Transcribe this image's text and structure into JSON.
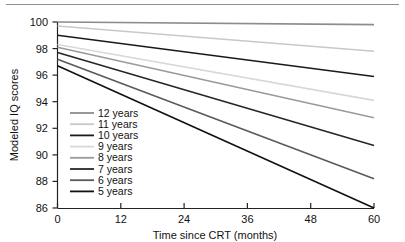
{
  "chart_data": {
    "type": "line",
    "title": "",
    "xlabel": "Time since CRT (months)",
    "ylabel": "Modeled IQ scores",
    "xlim": [
      0,
      60
    ],
    "ylim": [
      86,
      100
    ],
    "xticks": [
      0,
      12,
      24,
      36,
      48,
      60
    ],
    "yticks": [
      86,
      88,
      90,
      92,
      94,
      96,
      98,
      100
    ],
    "grid": false,
    "legend_position": "center-left",
    "series": [
      {
        "name": "12 years",
        "color": "#8c8c8c",
        "x": [
          0,
          60
        ],
        "values": [
          100.0,
          99.8
        ]
      },
      {
        "name": "11 years",
        "color": "#c8c8c8",
        "x": [
          0,
          60
        ],
        "values": [
          99.7,
          97.8
        ]
      },
      {
        "name": "10 years",
        "color": "#1a1a1a",
        "x": [
          0,
          60
        ],
        "values": [
          99.0,
          95.9
        ]
      },
      {
        "name": "9 years",
        "color": "#d8d8d8",
        "x": [
          0,
          60
        ],
        "values": [
          98.3,
          94.1
        ]
      },
      {
        "name": "8 years",
        "color": "#9a9a9a",
        "x": [
          0,
          60
        ],
        "values": [
          98.1,
          92.8
        ]
      },
      {
        "name": "7 years",
        "color": "#262626",
        "x": [
          0,
          60
        ],
        "values": [
          97.7,
          90.7
        ]
      },
      {
        "name": "6 years",
        "color": "#5a5a5a",
        "x": [
          0,
          60
        ],
        "values": [
          97.2,
          88.2
        ]
      },
      {
        "name": "5 years",
        "color": "#111111",
        "x": [
          0,
          60
        ],
        "values": [
          96.7,
          86.0
        ]
      }
    ]
  },
  "axes": {
    "y_label": "Modeled IQ scores",
    "x_label": "Time since CRT (months)",
    "y_ticks": [
      "100",
      "98",
      "96",
      "94",
      "92",
      "90",
      "88",
      "86"
    ],
    "x_ticks": [
      "0",
      "12",
      "24",
      "36",
      "48",
      "60"
    ]
  },
  "legend": {
    "items": [
      {
        "label": "12 years"
      },
      {
        "label": "11 years"
      },
      {
        "label": "10 years"
      },
      {
        "label": "9 years"
      },
      {
        "label": "8 years"
      },
      {
        "label": "7 years"
      },
      {
        "label": "6 years"
      },
      {
        "label": "5 years"
      }
    ]
  }
}
